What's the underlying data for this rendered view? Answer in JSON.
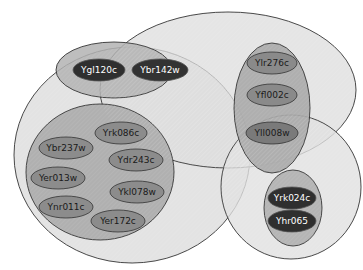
{
  "diagram": {
    "type": "nested-venn",
    "colors": {
      "outer_fill": "#e6e6e6",
      "outer_stroke": "#333333",
      "inner_fill": "#b7b7b7",
      "inner_fill_alt": "#a6a6a6",
      "node_mid": "#8c8c8c",
      "node_dark": "#2e2e2e"
    },
    "sets": {
      "left_large": {
        "label": "Left large group"
      },
      "top_right": {
        "label": "Top right group"
      },
      "bottom_right": {
        "label": "Bottom right group"
      }
    },
    "nodes": {
      "n1": "Ygl120c",
      "n2": "Ybr142w",
      "n3": "Ylr276c",
      "n4": "Yfl002c",
      "n5": "Yll008w",
      "n6": "Yrk086c",
      "n7": "Ybr237w",
      "n8": "Ydr243c",
      "n9": "Yer013w",
      "n10": "Ykl078w",
      "n11": "Ynr011c",
      "n12": "Yer172c",
      "n13": "Yrk024c",
      "n14": "Yhr065"
    }
  }
}
